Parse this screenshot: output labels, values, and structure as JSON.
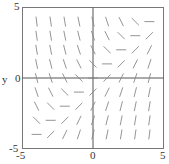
{
  "chart_data": {
    "type": "direction_field",
    "title": "",
    "xlabel": "x",
    "ylabel": "y",
    "xlim": [
      -5,
      5
    ],
    "ylim": [
      -5,
      5
    ],
    "x_ticks": [
      "-5",
      "0",
      "5"
    ],
    "y_ticks": [
      "-5",
      "0",
      "5"
    ],
    "grid": false,
    "equation_slope": "dy/dx = x - y",
    "sample_x": [
      -4,
      -3,
      -2,
      -1,
      0,
      1,
      2,
      3,
      4
    ],
    "sample_y": [
      -4,
      -3,
      -2,
      -1,
      0,
      1,
      2,
      3,
      4
    ],
    "segment_color": "#888888",
    "axis_color": "#555555",
    "frame_color": "#777777"
  },
  "labels": {
    "y_axis": "y",
    "x_axis": "x",
    "x_min": "-5",
    "x_mid": "0",
    "x_max": "5",
    "y_min": "-5",
    "y_mid": "0",
    "y_max": "5"
  }
}
